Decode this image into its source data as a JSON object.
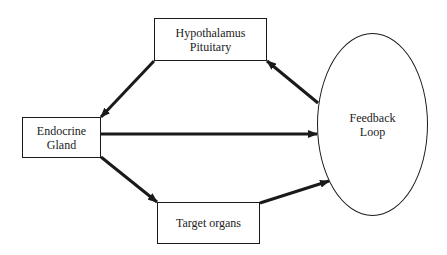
{
  "diagram": {
    "nodes": {
      "hypothalamus": {
        "line1": "Hypothalamus",
        "line2": "Pituitary"
      },
      "endocrine": {
        "line1": "Endocrine",
        "line2": "Gland"
      },
      "target": {
        "label": "Target organs"
      },
      "feedback": {
        "line1": "Feedback",
        "line2": "Loop"
      }
    },
    "edges": [
      {
        "from": "Hypothalamus Pituitary",
        "to": "Endocrine Gland"
      },
      {
        "from": "Endocrine Gland",
        "to": "Feedback Loop"
      },
      {
        "from": "Endocrine Gland",
        "to": "Target organs"
      },
      {
        "from": "Target organs",
        "to": "Feedback Loop"
      },
      {
        "from": "Feedback Loop",
        "to": "Hypothalamus Pituitary"
      }
    ],
    "colors": {
      "stroke": "#1a1a1a",
      "background": "#ffffff"
    }
  }
}
